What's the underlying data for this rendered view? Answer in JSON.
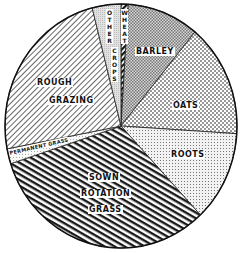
{
  "chart_data": {
    "type": "pie",
    "title": "",
    "start_angle_deg": 0,
    "direction": "clockwise",
    "categories": [
      "Wheat",
      "Barley",
      "Oats",
      "Roots",
      "Sown Rotation Grass",
      "Permanent Grass",
      "Rough Grazing",
      "Other Crops"
    ],
    "values": [
      1,
      10,
      15,
      12,
      32,
      2,
      24,
      4
    ],
    "unit": "percent (estimated from slice angles)",
    "slices": [
      {
        "label": "WHEAT",
        "value": 1,
        "pattern": "bold-diagonal-hatch"
      },
      {
        "label": "BARLEY",
        "value": 10,
        "pattern": "dense-crosshatch"
      },
      {
        "label": "OATS",
        "value": 15,
        "pattern": "open-crosshatch"
      },
      {
        "label": "ROOTS",
        "value": 12,
        "pattern": "fine-dots"
      },
      {
        "label": "SOWN ROTATION GRASS",
        "value": 32,
        "pattern": "heavy-diagonal-stripes"
      },
      {
        "label": "PERMANENT GRASS",
        "value": 2,
        "pattern": "light-dots"
      },
      {
        "label": "ROUGH GRAZING",
        "value": 24,
        "pattern": "light-diagonal-hatch"
      },
      {
        "label": "OTHER CROPS",
        "value": 4,
        "pattern": "light-stipple"
      }
    ],
    "legend": "none (labels drawn inside slices)",
    "grid": false
  },
  "labels": {
    "wheat": "WHEAT",
    "barley": "BARLEY",
    "oats": "OATS",
    "roots": "ROOTS",
    "sown_1": "SOWN",
    "sown_2": "ROTATION",
    "sown_3": "GRASS",
    "permanent": "PERMANENT GRASS",
    "rough_1": "ROUGH",
    "rough_2": "GRAZING",
    "other": "OTHER",
    "crops": "CROPS"
  }
}
